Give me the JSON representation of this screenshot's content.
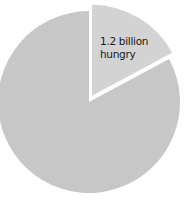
{
  "chart_data": {
    "type": "pie",
    "title": "",
    "slices": [
      {
        "label": "1.2 billion hungry",
        "value": 1.2,
        "percent": 17,
        "exploded": true,
        "color": "#d3d3d3"
      },
      {
        "label": "",
        "value": 5.8,
        "percent": 83,
        "exploded": false,
        "color": "#c7c7c7"
      }
    ],
    "annotations": [
      {
        "text_line1": "1.2 billion",
        "text_line2": "hungry"
      }
    ]
  },
  "colors": {
    "main_slice": "#c7c7c7",
    "hungry_slice": "#d3d3d3",
    "background": "#ffffff",
    "text": "#1a1a1a"
  }
}
